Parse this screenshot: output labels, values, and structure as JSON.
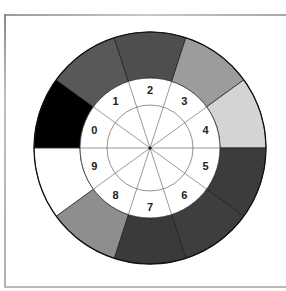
{
  "diagram": {
    "type": "color-wheel",
    "center": [
      150,
      148
    ],
    "outer_radius": 116,
    "inner_radius": 70,
    "reference_circle_radius": 43,
    "segments": [
      {
        "label": "0",
        "color": "#000000"
      },
      {
        "label": "1",
        "color": "#585858"
      },
      {
        "label": "2",
        "color": "#4e4e4e"
      },
      {
        "label": "3",
        "color": "#9c9c9c"
      },
      {
        "label": "4",
        "color": "#d4d4d4"
      },
      {
        "label": "5",
        "color": "#3c3c3c"
      },
      {
        "label": "6",
        "color": "#3e3e3e"
      },
      {
        "label": "7",
        "color": "#3a3a3a"
      },
      {
        "label": "8",
        "color": "#8e8e8e"
      },
      {
        "label": "9",
        "color": "#ffffff"
      }
    ]
  }
}
